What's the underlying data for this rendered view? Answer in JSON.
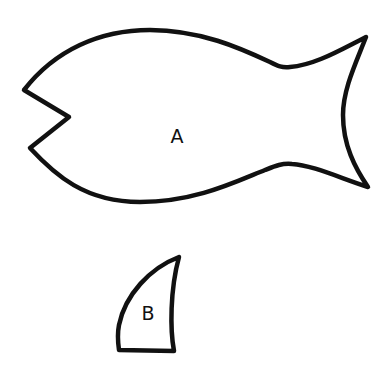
{
  "diagram": {
    "shapes": [
      {
        "id": "A",
        "label": "A",
        "description": "fish body with open mouth and forked tail"
      },
      {
        "id": "B",
        "label": "B",
        "description": "curved fin"
      }
    ],
    "colors": {
      "stroke": "#111111",
      "fill": "#ffffff",
      "background": "#ffffff"
    }
  }
}
